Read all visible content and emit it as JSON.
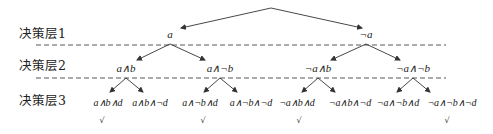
{
  "layers": [
    {
      "label": "决策层1"
    },
    {
      "label": "决策层2"
    },
    {
      "label": "决策层3"
    }
  ],
  "tree": {
    "level1": [
      {
        "label": "a"
      },
      {
        "label": "¬a"
      }
    ],
    "level2": [
      {
        "label": "a∧b"
      },
      {
        "label": "a∧¬b"
      },
      {
        "label": "¬a∧b"
      },
      {
        "label": "¬a∧¬b"
      }
    ],
    "level3": [
      {
        "label": "a∧b∧d",
        "checked": true
      },
      {
        "label": "a∧b∧¬d",
        "checked": false
      },
      {
        "label": "a∧¬b∧d",
        "checked": true
      },
      {
        "label": "a∧¬b∧¬d",
        "checked": false
      },
      {
        "label": "¬a∧b∧d",
        "checked": true
      },
      {
        "label": "¬a∧b∧¬d",
        "checked": false
      },
      {
        "label": "¬a∧¬b∧d",
        "checked": false
      },
      {
        "label": "¬a∧¬b∧¬d",
        "checked": true
      }
    ]
  },
  "check_mark": "√",
  "colors": {
    "line": "#333333",
    "dash": "#444444",
    "text": "#222222"
  }
}
